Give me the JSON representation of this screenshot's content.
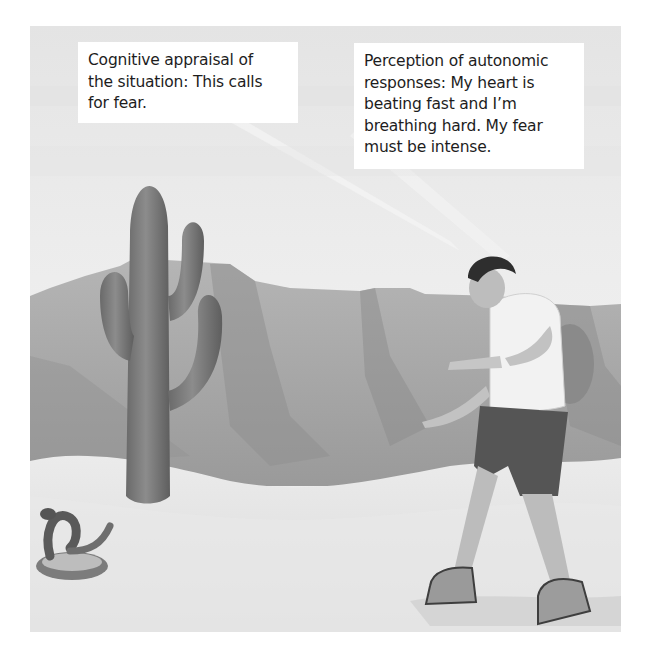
{
  "figure": {
    "scene_description": "Desert scene: hiker recoiling from a rattlesnake beside a saguaro cactus, mesas in background",
    "palette": {
      "sky": "#e8e8e8",
      "mesa": "#a8a8a8",
      "mesa_shadow": "#8e8e8e",
      "sand": "#e3e3e3",
      "cactus": "#7a7a7a",
      "text": "#1d1d1d",
      "caption_bg": "#ffffff"
    }
  },
  "captions": {
    "left": {
      "lines": [
        "Cognitive appraisal of",
        "the situation: This calls",
        "for fear."
      ]
    },
    "right": {
      "lines": [
        "Perception of autonomic",
        "responses: My heart is",
        "beating fast and I’m",
        "breathing hard. My fear",
        "must be intense."
      ]
    }
  }
}
